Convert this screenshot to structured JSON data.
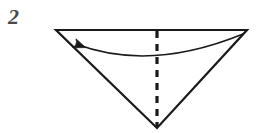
{
  "figure": {
    "kind": "origami-fold-diagram",
    "step_number": "2",
    "background_color": "#ffffff",
    "ink_color": "#1a1a1a",
    "step_number_color": "#4a4a4a",
    "caption": "",
    "shape": {
      "name": "inverted-triangle",
      "description": "downward pointing triangle",
      "vertices": {
        "top_left": [
          56,
          30
        ],
        "top_right": [
          247,
          30
        ],
        "bottom_apex": [
          157,
          128
        ]
      },
      "stroke_width": 2.2
    },
    "fold_line": {
      "name": "valley-fold-line",
      "style": "dashed",
      "from": [
        157,
        31
      ],
      "to": [
        157,
        127
      ],
      "dash": "7 6",
      "stroke_width": 3.2
    },
    "arrow": {
      "name": "fold-direction-arrow",
      "direction": "right-to-left",
      "start": [
        243,
        34
      ],
      "control": [
        150,
        72
      ],
      "end": [
        76,
        44
      ],
      "head_tip": [
        64,
        37
      ],
      "stroke_width": 1.5,
      "head_style": "solid-filled-triangle"
    }
  }
}
